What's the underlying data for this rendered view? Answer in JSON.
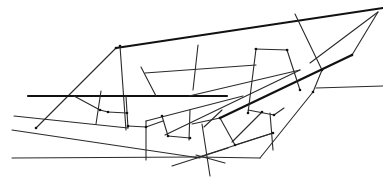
{
  "diagram": {
    "title": "",
    "stroke_color": "#1a1a1a",
    "background": "#ffffff",
    "segments": [
      {
        "id": "top-boundary",
        "weight": "thick",
        "from": [
          116,
          48
        ],
        "to": [
          383,
          8
        ]
      },
      {
        "id": "left-diagonal",
        "weight": "thin",
        "from": [
          116,
          48
        ],
        "to": [
          36,
          128
        ]
      },
      {
        "id": "left-vertical-a",
        "weight": "thin",
        "from": [
          120,
          46
        ],
        "to": [
          126,
          130
        ]
      },
      {
        "id": "horizontal-thick",
        "weight": "thick",
        "from": [
          28,
          96
        ],
        "to": [
          227,
          96
        ]
      },
      {
        "id": "right-boundary-thick",
        "weight": "thick",
        "from": [
          220,
          118
        ],
        "to": [
          352,
          55
        ]
      },
      {
        "id": "top-right-diagonal-a",
        "weight": "thin",
        "from": [
          378,
          12
        ],
        "to": [
          352,
          55
        ]
      },
      {
        "id": "top-right-diagonal-b",
        "weight": "thin",
        "from": [
          378,
          12
        ],
        "to": [
          310,
          63
        ]
      },
      {
        "id": "mid-vertical-right",
        "weight": "thin",
        "from": [
          295,
          14
        ],
        "to": [
          322,
          70
        ]
      },
      {
        "id": "mid-vertical-right-b",
        "weight": "thin",
        "from": [
          322,
          70
        ],
        "to": [
          313,
          92
        ]
      },
      {
        "id": "lower-right-long",
        "weight": "thin",
        "from": [
          313,
          92
        ],
        "to": [
          260,
          158
        ]
      },
      {
        "id": "right-horizontal",
        "weight": "thin",
        "from": [
          316,
          88
        ],
        "to": [
          383,
          86
        ]
      },
      {
        "id": "inner-horizontal-a",
        "weight": "thin",
        "from": [
          145,
          73
        ],
        "to": [
          256,
          65
        ]
      },
      {
        "id": "inner-diagonal-a",
        "weight": "thin",
        "from": [
          141,
          67
        ],
        "to": [
          156,
          96
        ]
      },
      {
        "id": "inner-vertical-b",
        "weight": "thin",
        "from": [
          198,
          45
        ],
        "to": [
          193,
          90
        ]
      },
      {
        "id": "inner-horizontal-b",
        "weight": "thin",
        "from": [
          255,
          49
        ],
        "to": [
          288,
          50
        ]
      },
      {
        "id": "inner-vertical-c",
        "weight": "thin",
        "from": [
          256,
          49
        ],
        "to": [
          248,
          113
        ]
      },
      {
        "id": "inner-vertical-d",
        "weight": "thin",
        "from": [
          287,
          50
        ],
        "to": [
          300,
          90
        ]
      },
      {
        "id": "inner-diagonal-b",
        "weight": "thin",
        "from": [
          300,
          70
        ],
        "to": [
          165,
          135
        ]
      },
      {
        "id": "inner-diagonal-c",
        "weight": "thin",
        "from": [
          189,
          96
        ],
        "to": [
          300,
          70
        ]
      },
      {
        "id": "left-lower-a",
        "weight": "thin",
        "from": [
          14,
          116
        ],
        "to": [
          128,
          128
        ]
      },
      {
        "id": "left-short-a",
        "weight": "thin",
        "from": [
          74,
          96
        ],
        "to": [
          100,
          110
        ]
      },
      {
        "id": "left-short-b",
        "weight": "thin",
        "from": [
          100,
          110
        ],
        "to": [
          108,
          112
        ]
      },
      {
        "id": "left-vertical-b",
        "weight": "thin",
        "from": [
          101,
          91
        ],
        "to": [
          96,
          124
        ]
      },
      {
        "id": "left-short-c",
        "weight": "thin",
        "from": [
          108,
          112
        ],
        "to": [
          127,
          113
        ]
      },
      {
        "id": "left-vertical-c",
        "weight": "thin",
        "from": [
          126,
          96
        ],
        "to": [
          128,
          128
        ]
      },
      {
        "id": "mid-link-a",
        "weight": "thin",
        "from": [
          128,
          126
        ],
        "to": [
          146,
          127
        ]
      },
      {
        "id": "mid-link-b",
        "weight": "thin",
        "from": [
          146,
          127
        ],
        "to": [
          163,
          121
        ]
      },
      {
        "id": "mid-vertical-a",
        "weight": "thin",
        "from": [
          146,
          121
        ],
        "to": [
          146,
          160
        ]
      },
      {
        "id": "mid-upward",
        "weight": "thin",
        "from": [
          146,
          121
        ],
        "to": [
          243,
          96
        ]
      },
      {
        "id": "mid-diag-short",
        "weight": "thin",
        "from": [
          162,
          116
        ],
        "to": [
          168,
          136
        ]
      },
      {
        "id": "mid-horizontal-short",
        "weight": "thin",
        "from": [
          168,
          136
        ],
        "to": [
          190,
          138
        ]
      },
      {
        "id": "mid-vertical-b",
        "weight": "thin",
        "from": [
          190,
          110
        ],
        "to": [
          189,
          140
        ]
      },
      {
        "id": "lower-diagonal",
        "weight": "thin",
        "from": [
          12,
          130
        ],
        "to": [
          200,
          158
        ]
      },
      {
        "id": "bottom-horizontal",
        "weight": "thin",
        "from": [
          12,
          158
        ],
        "to": [
          196,
          157
        ]
      },
      {
        "id": "bottom-right-horizontal",
        "weight": "thin",
        "from": [
          196,
          157
        ],
        "to": [
          260,
          158
        ]
      },
      {
        "id": "bottom-cross-a",
        "weight": "thin",
        "from": [
          172,
          166
        ],
        "to": [
          228,
          148
        ]
      },
      {
        "id": "bottom-cross-b",
        "weight": "thin",
        "from": [
          196,
          155
        ],
        "to": [
          225,
          163
        ]
      },
      {
        "id": "bottom-vertical",
        "weight": "thin",
        "from": [
          202,
          124
        ],
        "to": [
          210,
          176
        ]
      },
      {
        "id": "right-cluster-a",
        "weight": "thin",
        "from": [
          192,
          124
        ],
        "to": [
          220,
          118
        ]
      },
      {
        "id": "right-cluster-b",
        "weight": "thin",
        "from": [
          220,
          118
        ],
        "to": [
          235,
          145
        ]
      },
      {
        "id": "right-cluster-c",
        "weight": "thin",
        "from": [
          235,
          145
        ],
        "to": [
          273,
          133
        ]
      },
      {
        "id": "right-cluster-d",
        "weight": "thin",
        "from": [
          232,
          142
        ],
        "to": [
          262,
          112
        ]
      },
      {
        "id": "right-cluster-e",
        "weight": "thin",
        "from": [
          248,
          110
        ],
        "to": [
          274,
          115
        ]
      },
      {
        "id": "right-cluster-f",
        "weight": "thin",
        "from": [
          270,
          113
        ],
        "to": [
          273,
          150
        ]
      },
      {
        "id": "right-cluster-g",
        "weight": "thin",
        "from": [
          274,
          115
        ],
        "to": [
          284,
          108
        ]
      },
      {
        "id": "right-cluster-h",
        "weight": "thin",
        "from": [
          273,
          133
        ],
        "to": [
          196,
          158
        ]
      },
      {
        "id": "right-cluster-i",
        "weight": "thin",
        "from": [
          204,
          127
        ],
        "to": [
          222,
          110
        ]
      }
    ],
    "nodes": [
      [
        116,
        48
      ],
      [
        120,
        46
      ],
      [
        352,
        55
      ],
      [
        322,
        70
      ],
      [
        313,
        92
      ],
      [
        256,
        49
      ],
      [
        287,
        50
      ],
      [
        100,
        110
      ],
      [
        108,
        112
      ],
      [
        127,
        113
      ],
      [
        128,
        126
      ],
      [
        146,
        127
      ],
      [
        162,
        116
      ],
      [
        168,
        136
      ],
      [
        190,
        138
      ],
      [
        220,
        118
      ],
      [
        235,
        145
      ],
      [
        273,
        133
      ],
      [
        274,
        115
      ],
      [
        36,
        128
      ],
      [
        262,
        112
      ],
      [
        300,
        90
      ],
      [
        248,
        113
      ]
    ]
  }
}
